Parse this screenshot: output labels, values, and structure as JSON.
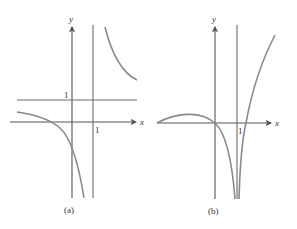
{
  "figure": {
    "panels": [
      {
        "id": "a",
        "caption": "(a)",
        "axis_labels": {
          "x": "x",
          "y": "y"
        },
        "tick_labels": {
          "y_one": "1",
          "x_one": "1"
        },
        "asymptotes": {
          "vertical": "x = 1",
          "horizontal": "y = 1"
        }
      },
      {
        "id": "b",
        "caption": "(b)",
        "axis_labels": {
          "x": "x",
          "y": "y"
        },
        "tick_labels": {
          "x_one": "1"
        },
        "asymptotes": {
          "vertical": "x = 1"
        }
      }
    ],
    "colors": {
      "axis": "#555555",
      "asymptote": "#6a6a6a",
      "curve": "#8a8a8a"
    }
  }
}
